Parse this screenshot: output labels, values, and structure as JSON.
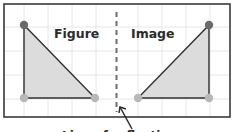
{
  "diagram": {
    "figure_label": "Figure",
    "image_label": "Image",
    "caption": "Line of reflection",
    "colors": {
      "frame": "#3a3a3a",
      "grid": "#e4e4e4",
      "fill": "#dcdcdc",
      "edge": "#2f2f2f",
      "vertex_top": "#6a6a6a",
      "vertex_bottom": "#b5b5b5",
      "axis": "#6e6e6e"
    },
    "figure_triangle": {
      "vertices": [
        [
          24,
          25
        ],
        [
          24,
          98
        ],
        [
          95,
          98
        ]
      ]
    },
    "image_triangle": {
      "vertices": [
        [
          209,
          25
        ],
        [
          209,
          98
        ],
        [
          138,
          98
        ]
      ]
    },
    "mirror_line_x": 116.5
  }
}
